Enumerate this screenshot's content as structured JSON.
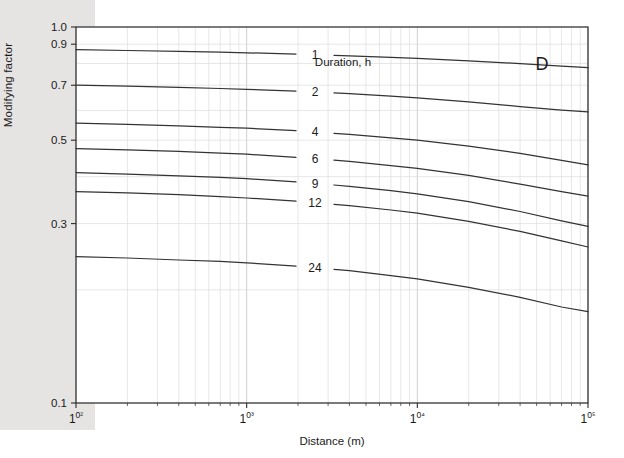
{
  "figure": {
    "panel_letter": "D",
    "legend_title": "Duration, h",
    "xlabel": "Distance (m)",
    "ylabel": "Modifying factor",
    "colors": {
      "curve": "#333333",
      "grid_minor": "#dcdcdc",
      "grid_major": "#c9c9c9",
      "axis": "#2b2b2b",
      "text": "#1a1a1a",
      "margin_band": "#e6e4e2"
    }
  },
  "chart_data": {
    "type": "line",
    "title": "",
    "panel": "D",
    "xlabel": "Distance (m)",
    "ylabel": "Modifying factor",
    "xscale": "log",
    "yscale": "log",
    "xlim": [
      100,
      100000
    ],
    "ylim": [
      0.1,
      1.0
    ],
    "grid": true,
    "legend_title": "Duration, h",
    "legend_position": "inline-on-curves",
    "xticks": [
      100,
      1000,
      10000,
      100000
    ],
    "xticklabels": [
      "10²",
      "10³",
      "10⁴",
      "10⁵"
    ],
    "yticks": [
      0.1,
      0.3,
      0.5,
      0.7,
      0.9,
      1.0
    ],
    "yticklabels": [
      "0.1",
      "0.3",
      "0.5",
      "0.7",
      "0.9",
      "1.0"
    ],
    "x": [
      100,
      200,
      400,
      700,
      1000,
      2000,
      4000,
      7000,
      10000,
      20000,
      40000,
      70000,
      100000
    ],
    "series": [
      {
        "name": "1",
        "label": "1",
        "values": [
          0.87,
          0.866,
          0.861,
          0.857,
          0.854,
          0.847,
          0.838,
          0.83,
          0.825,
          0.813,
          0.799,
          0.787,
          0.78
        ]
      },
      {
        "name": "2",
        "label": "2",
        "values": [
          0.7,
          0.696,
          0.691,
          0.686,
          0.683,
          0.675,
          0.665,
          0.655,
          0.648,
          0.632,
          0.614,
          0.601,
          0.595
        ]
      },
      {
        "name": "4",
        "label": "4",
        "values": [
          0.555,
          0.551,
          0.546,
          0.541,
          0.538,
          0.53,
          0.518,
          0.507,
          0.5,
          0.482,
          0.461,
          0.442,
          0.43
        ]
      },
      {
        "name": "6",
        "label": "6",
        "values": [
          0.475,
          0.471,
          0.467,
          0.462,
          0.459,
          0.45,
          0.439,
          0.428,
          0.421,
          0.403,
          0.382,
          0.365,
          0.355
        ]
      },
      {
        "name": "9",
        "label": "9",
        "values": [
          0.41,
          0.406,
          0.402,
          0.398,
          0.395,
          0.387,
          0.377,
          0.367,
          0.36,
          0.343,
          0.323,
          0.305,
          0.295
        ]
      },
      {
        "name": "12",
        "label": "12",
        "values": [
          0.365,
          0.362,
          0.358,
          0.354,
          0.351,
          0.344,
          0.335,
          0.326,
          0.32,
          0.304,
          0.286,
          0.27,
          0.26
        ]
      },
      {
        "name": "24",
        "label": "24",
        "values": [
          0.245,
          0.243,
          0.24,
          0.238,
          0.236,
          0.231,
          0.225,
          0.218,
          0.214,
          0.203,
          0.191,
          0.18,
          0.175
        ]
      }
    ]
  }
}
